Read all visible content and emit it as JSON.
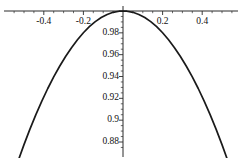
{
  "chart_data": {
    "type": "line",
    "title": "",
    "subtitle": "",
    "xlabel": "",
    "ylabel": "",
    "grid": false,
    "legend": null,
    "axis_style": "mathematica-crossing-axes",
    "xlim": [
      -0.555,
      0.555
    ],
    "ylim": [
      0.868,
      1.002
    ],
    "x_axis_position_y": 1.0,
    "y_axis_position_x": 0.0,
    "xticks_major": [
      -0.4,
      -0.2,
      0.2,
      0.4
    ],
    "xticks_major_labels": [
      "-0.4",
      "-0.2",
      "0.2",
      "0.4"
    ],
    "xticks_minor_step": 0.05,
    "yticks_major": [
      0.98,
      0.96,
      0.94,
      0.92,
      0.9,
      0.88
    ],
    "yticks_major_labels": [
      "0.98",
      "0.96",
      "0.94",
      "0.92",
      "0.9",
      "0.88"
    ],
    "yticks_minor_step": 0.005,
    "series": [
      {
        "name": "cos-like parabola",
        "color": "#1a1a1a",
        "linewidth": 1.7,
        "x": [
          -0.53,
          -0.5,
          -0.47,
          -0.44,
          -0.41,
          -0.38,
          -0.35,
          -0.32,
          -0.29,
          -0.26,
          -0.23,
          -0.2,
          -0.17,
          -0.14,
          -0.11,
          -0.08,
          -0.05,
          -0.02,
          0.0,
          0.02,
          0.05,
          0.08,
          0.11,
          0.14,
          0.17,
          0.2,
          0.23,
          0.26,
          0.29,
          0.32,
          0.35,
          0.38,
          0.41,
          0.44,
          0.47,
          0.5,
          0.53
        ],
        "y": [
          0.8625,
          0.8776,
          0.8918,
          0.9051,
          0.9175,
          0.929,
          0.9396,
          0.9494,
          0.9583,
          0.9664,
          0.9737,
          0.9801,
          0.9857,
          0.9903,
          0.994,
          0.9968,
          0.9988,
          0.9998,
          1.0,
          0.9998,
          0.9988,
          0.9968,
          0.994,
          0.9903,
          0.9857,
          0.9801,
          0.9737,
          0.9664,
          0.9583,
          0.9494,
          0.9396,
          0.929,
          0.9175,
          0.9051,
          0.8918,
          0.8776,
          0.8625
        ]
      }
    ]
  },
  "colors": {
    "curve": "#1a1a1a",
    "axis": "#2b2b2b",
    "text": "#111111",
    "background": "#ffffff"
  }
}
